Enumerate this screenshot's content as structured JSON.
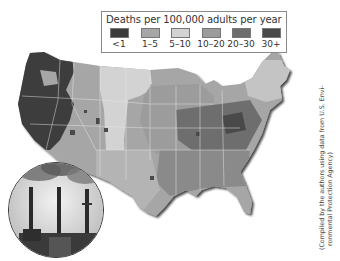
{
  "legend": {
    "title": "Deaths per 100,000 adults per year",
    "items": [
      {
        "label": "<1",
        "color": "#3c3c3c"
      },
      {
        "label": "1–5",
        "color": "#a6a6a6"
      },
      {
        "label": "5–10",
        "color": "#d3d3d3"
      },
      {
        "label": "10–20",
        "color": "#9c9c9c"
      },
      {
        "label": "20–30",
        "color": "#6e6e6e"
      },
      {
        "label": "30+",
        "color": "#4a4a4a"
      }
    ]
  },
  "map": {
    "subject": "United States choropleth of deaths per 100,000 adults per year (fine particulate air pollution)",
    "regions": [
      {
        "name": "Pacific Northwest / West",
        "category": "<1"
      },
      {
        "name": "Northern Rockies / Plains",
        "category": "1–5"
      },
      {
        "name": "Central Plains band",
        "category": "5–10"
      },
      {
        "name": "Texas / Southwest",
        "category": "1–5"
      },
      {
        "name": "Midwest",
        "category": "10–20"
      },
      {
        "name": "Ohio Valley / Appalachia",
        "category": "20–30"
      },
      {
        "name": "Southeast",
        "category": "10–20"
      },
      {
        "name": "Northeast",
        "category": "5–10"
      }
    ]
  },
  "photo": {
    "description": "Power plant smokestacks emitting smoke"
  },
  "caption": {
    "line1": "(Compiled by the authors using data from U.S. Envi-",
    "line2": "ronmental Protection Agency)"
  }
}
